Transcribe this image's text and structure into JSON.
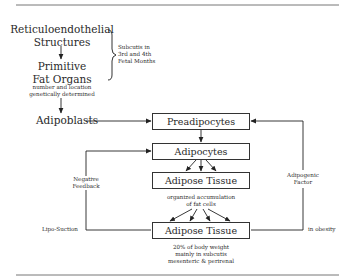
{
  "diagram": {
    "origin": {
      "line1": "Reticuloendothelial",
      "line2": "Structures"
    },
    "brace_note": {
      "line1": "Subcutis in",
      "line2": "3rd and 4th",
      "line3": "Fetal Months"
    },
    "primitive": {
      "line1": "Primitive",
      "line2": "Fat Organs",
      "note1": "number and location",
      "note2": "genetically determined"
    },
    "adipoblasts": "Adipoblasts",
    "boxes": {
      "preadipocytes": "Preadipocytes",
      "adipocytes": "Adipocytes",
      "adipose_tissue_1": "Adipose Tissue",
      "adipose_tissue_2": "Adipose Tissue"
    },
    "tissue_note": {
      "line1": "organized accumulation",
      "line2": "of fat cells"
    },
    "final_note": {
      "line1": "20% of body weight",
      "line2": "mainly in subcutis",
      "line3": "mesenteric & perirenal"
    },
    "left_loop": {
      "label1": "Negative",
      "label2": "Feedback",
      "end_label": "Lipo-Suction"
    },
    "right_loop": {
      "label1": "Adipogenic",
      "label2": "Factor",
      "end_label": "in obesity"
    }
  }
}
